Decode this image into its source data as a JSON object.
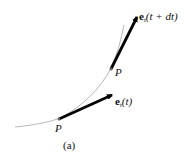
{
  "figure": {
    "caption": "(a)",
    "points": [
      {
        "label": "P",
        "name": "point-p-lower"
      },
      {
        "label": "P",
        "name": "point-p-upper"
      }
    ],
    "vectors": [
      {
        "symbol": "e",
        "subscript": "t",
        "argument": "(t)"
      },
      {
        "symbol": "e",
        "subscript": "t",
        "argument": "(t + dt)"
      }
    ],
    "colors": {
      "curve": "#b8b8b8",
      "arrow": "#000000",
      "text": "#111111"
    }
  }
}
